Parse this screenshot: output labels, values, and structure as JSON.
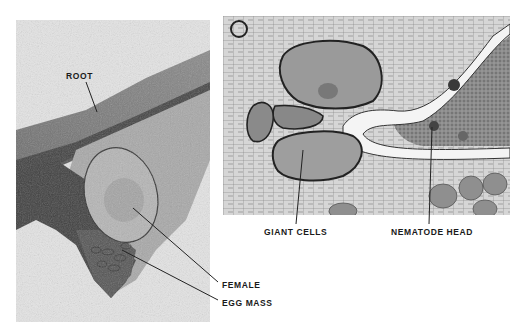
{
  "figure": {
    "left_panel": {
      "description": "micrograph of root with nematode female and egg mass",
      "labels": [
        {
          "id": "root",
          "text": "ROOT"
        },
        {
          "id": "female",
          "text": "FEMALE"
        },
        {
          "id": "egg_mass",
          "text": "EGG MASS"
        }
      ]
    },
    "right_panel": {
      "description": "section micrograph showing giant cells and nematode head",
      "labels": [
        {
          "id": "giant_cells",
          "text": "GIANT CELLS"
        },
        {
          "id": "nematode_head",
          "text": "NEMATODE HEAD"
        }
      ]
    },
    "colors": {
      "background": "#ffffff",
      "label_text": "#1a1a1a",
      "leader_line": "#222222"
    }
  }
}
